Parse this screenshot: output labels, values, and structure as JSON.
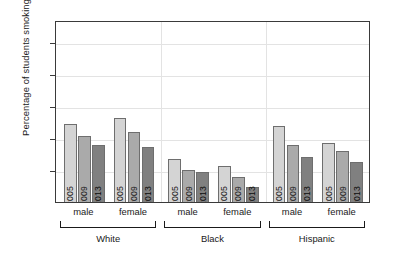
{
  "chart_data": {
    "type": "bar",
    "title": "",
    "xlabel": "",
    "ylabel": "Percentage of students smoking",
    "ylim": [
      0,
      57
    ],
    "yticks": [
      10,
      20,
      30,
      40,
      50
    ],
    "ytick_labels": [
      "10",
      "20",
      "30",
      "40",
      "50"
    ],
    "grid": "horizontal-and-group-separators",
    "legend": "none (year printed inside each bar)",
    "categories": [
      "2005",
      "2009",
      "2013"
    ],
    "group_labels": [
      "White",
      "Black",
      "Hispanic"
    ],
    "subgroup_labels": [
      "male",
      "female"
    ],
    "series": [
      {
        "name": "2005",
        "fill": "#d4d4d4"
      },
      {
        "name": "2009",
        "fill": "#aaaaaa"
      },
      {
        "name": "2013",
        "fill": "#808080"
      }
    ],
    "groups": [
      {
        "race": "White",
        "sexes": [
          {
            "sex": "male",
            "bars": [
              {
                "year": "2005",
                "value": 24.9
              },
              {
                "year": "2009",
                "value": 21.3
              },
              {
                "year": "2013",
                "value": 18.6
              }
            ]
          },
          {
            "sex": "female",
            "bars": [
              {
                "year": "2005",
                "value": 26.9
              },
              {
                "year": "2009",
                "value": 22.5
              },
              {
                "year": "2013",
                "value": 17.9
              }
            ]
          }
        ]
      },
      {
        "race": "Black",
        "sexes": [
          {
            "sex": "male",
            "bars": [
              {
                "year": "2005",
                "value": 14.0
              },
              {
                "year": "2009",
                "value": 10.7
              },
              {
                "year": "2013",
                "value": 10.0
              }
            ]
          },
          {
            "sex": "female",
            "bars": [
              {
                "year": "2005",
                "value": 11.9
              },
              {
                "year": "2009",
                "value": 8.4
              },
              {
                "year": "2013",
                "value": 5.3
              }
            ]
          }
        ]
      },
      {
        "race": "Hispanic",
        "sexes": [
          {
            "sex": "male",
            "bars": [
              {
                "year": "2005",
                "value": 24.4
              },
              {
                "year": "2009",
                "value": 18.5
              },
              {
                "year": "2013",
                "value": 14.8
              }
            ]
          },
          {
            "sex": "female",
            "bars": [
              {
                "year": "2005",
                "value": 19.2
              },
              {
                "year": "2009",
                "value": 16.7
              },
              {
                "year": "2013",
                "value": 13.0
              }
            ]
          }
        ]
      }
    ],
    "colors": {
      "bar_2005": "#d4d4d4",
      "bar_2009": "#aaaaaa",
      "bar_2013": "#808080",
      "bar_border": "#6e6e6e",
      "axis": "#3a3a3a",
      "gridline": "#e3e3e3",
      "text": "#1a1a1a",
      "background": "#ffffff"
    }
  }
}
